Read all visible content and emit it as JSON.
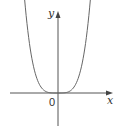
{
  "chart_data": {
    "type": "line",
    "title": "",
    "xlabel": "x",
    "ylabel": "y",
    "origin_label": "0",
    "function_shape": "even, flat-bottomed U curve with minimum at origin (like y = x^4)",
    "series": [
      {
        "name": "curve",
        "x": [
          -1.0,
          -0.8,
          -0.6,
          -0.4,
          -0.2,
          0.0,
          0.2,
          0.4,
          0.6,
          0.8,
          1.0
        ],
        "values": [
          1.0,
          0.41,
          0.13,
          0.026,
          0.0016,
          0.0,
          0.0016,
          0.026,
          0.13,
          0.41,
          1.0
        ]
      }
    ],
    "grid": false,
    "legend": null,
    "ticks": {
      "x": [],
      "y": []
    },
    "colors": {
      "curve": "#555555",
      "axes": "#555555"
    }
  },
  "labels": {
    "x_axis": "x",
    "y_axis": "y",
    "origin": "0"
  }
}
